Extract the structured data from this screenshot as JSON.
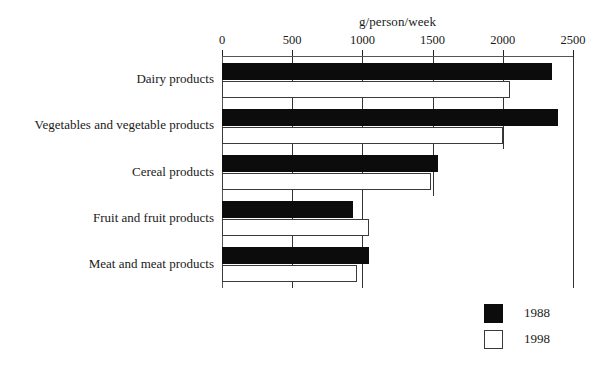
{
  "chart_data": {
    "type": "bar",
    "orientation": "horizontal",
    "title": "",
    "xlabel": "g/person/week",
    "ylabel": "",
    "xlim": [
      0,
      2500
    ],
    "xticks": [
      0,
      500,
      1000,
      1500,
      2000,
      2500
    ],
    "xtick_labels": [
      "0",
      "500",
      "1000",
      "1500",
      "2000",
      "2500"
    ],
    "grid": true,
    "grid_axis": "x",
    "legend_position": "bottom-right",
    "categories": [
      "Dairy products",
      "Vegetables and vegetable products",
      "Cereal products",
      "Fruit and fruit products",
      "Meat and meat products"
    ],
    "series": [
      {
        "name": "1988",
        "color": "#0c0c0c",
        "values": [
          2350,
          2390,
          1540,
          930,
          1050
        ]
      },
      {
        "name": "1998",
        "color": "#ffffff",
        "values": [
          2050,
          2000,
          1490,
          1050,
          960
        ]
      }
    ]
  },
  "axis": {
    "unit_label": "g/person/week"
  },
  "legend": {
    "entries": [
      {
        "label": "1988",
        "swatch": "filled-black"
      },
      {
        "label": "1998",
        "swatch": "outlined-white"
      }
    ]
  }
}
